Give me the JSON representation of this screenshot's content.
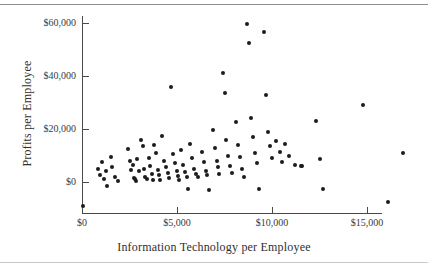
{
  "figure": {
    "has_top_rule": true,
    "has_bottom_rule": true,
    "background_color": "#ffffff",
    "point_color": "#1c1c1c",
    "axis_color": "#4a4a4a"
  },
  "chart_data": {
    "type": "scatter",
    "title": "",
    "xlabel": "Information Technology per Employee",
    "ylabel": "Profits per Employee",
    "xlim": [
      0,
      17500
    ],
    "ylim": [
      -5000,
      65000
    ],
    "grid": false,
    "legend": null,
    "xticks": [
      0,
      5000,
      10000,
      15000
    ],
    "xticklabels": [
      "$0",
      "$5,000",
      "$10,000",
      "$15,000"
    ],
    "yticks": [
      0,
      20000,
      40000,
      60000
    ],
    "yticklabels": [
      "$0",
      "$20,000",
      "$40,000",
      "$60,000"
    ],
    "points": [
      [
        50,
        -9000
      ],
      [
        850,
        5000
      ],
      [
        950,
        2500
      ],
      [
        1050,
        7500
      ],
      [
        1150,
        1000
      ],
      [
        1250,
        4000
      ],
      [
        1300,
        -1500
      ],
      [
        1500,
        9500
      ],
      [
        1600,
        5500
      ],
      [
        1750,
        2000
      ],
      [
        1900,
        400
      ],
      [
        2400,
        12500
      ],
      [
        2500,
        8000
      ],
      [
        2600,
        4500
      ],
      [
        2700,
        6500
      ],
      [
        2750,
        1500
      ],
      [
        2800,
        1000
      ],
      [
        2850,
        300
      ],
      [
        2900,
        8500
      ],
      [
        3000,
        4000
      ],
      [
        3100,
        16000
      ],
      [
        3200,
        13500
      ],
      [
        3250,
        5000
      ],
      [
        3300,
        2000
      ],
      [
        3400,
        1200
      ],
      [
        3500,
        9000
      ],
      [
        3600,
        6000
      ],
      [
        3700,
        3000
      ],
      [
        3750,
        700
      ],
      [
        3800,
        14000
      ],
      [
        3900,
        11000
      ],
      [
        4000,
        4500
      ],
      [
        4050,
        2500
      ],
      [
        4100,
        600
      ],
      [
        4200,
        17500
      ],
      [
        4300,
        8000
      ],
      [
        4400,
        5500
      ],
      [
        4500,
        3500
      ],
      [
        4600,
        1500
      ],
      [
        4700,
        36000
      ],
      [
        4800,
        10500
      ],
      [
        4900,
        7000
      ],
      [
        5000,
        4000
      ],
      [
        5050,
        2200
      ],
      [
        5100,
        900
      ],
      [
        5200,
        12000
      ],
      [
        5300,
        6500
      ],
      [
        5400,
        3800
      ],
      [
        5500,
        1800
      ],
      [
        5600,
        -2500
      ],
      [
        5700,
        14500
      ],
      [
        5800,
        9000
      ],
      [
        5900,
        5000
      ],
      [
        6000,
        3200
      ],
      [
        6100,
        2000
      ],
      [
        6300,
        11500
      ],
      [
        6400,
        7500
      ],
      [
        6500,
        4200
      ],
      [
        6600,
        2800
      ],
      [
        6700,
        -3000
      ],
      [
        6900,
        19500
      ],
      [
        7000,
        13000
      ],
      [
        7100,
        8000
      ],
      [
        7150,
        5500
      ],
      [
        7200,
        3000
      ],
      [
        7400,
        41000
      ],
      [
        7500,
        33500
      ],
      [
        7600,
        16000
      ],
      [
        7700,
        10000
      ],
      [
        7800,
        6000
      ],
      [
        7900,
        3500
      ],
      [
        8100,
        22500
      ],
      [
        8200,
        14000
      ],
      [
        8300,
        9500
      ],
      [
        8400,
        5000
      ],
      [
        8500,
        2000
      ],
      [
        8700,
        59500
      ],
      [
        8800,
        52500
      ],
      [
        8900,
        24000
      ],
      [
        9000,
        17000
      ],
      [
        9100,
        11000
      ],
      [
        9200,
        7000
      ],
      [
        9300,
        -2800
      ],
      [
        9600,
        56500
      ],
      [
        9700,
        33000
      ],
      [
        9800,
        19000
      ],
      [
        9900,
        13500
      ],
      [
        10000,
        9000
      ],
      [
        10200,
        15500
      ],
      [
        10400,
        11500
      ],
      [
        10500,
        7500
      ],
      [
        10700,
        14500
      ],
      [
        10900,
        10000
      ],
      [
        11200,
        6500
      ],
      [
        11500,
        6200
      ],
      [
        11600,
        6000
      ],
      [
        12300,
        23000
      ],
      [
        12500,
        8500
      ],
      [
        12700,
        -2800
      ],
      [
        14800,
        29000
      ],
      [
        16100,
        -7500
      ],
      [
        16900,
        11000
      ]
    ]
  }
}
